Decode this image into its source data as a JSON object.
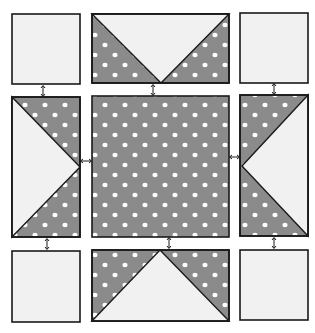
{
  "diagram": {
    "type": "quilt-block-assembly",
    "colors": {
      "background": "#ffffff",
      "light_fabric": "#f1f1f1",
      "dark_fabric": "#8b8b8b",
      "dots": "#ffffff",
      "outline": "#1a1a1a"
    },
    "grid": {
      "rows": 3,
      "cols": 3
    },
    "units": [
      {
        "id": "top-left",
        "kind": "plain-square",
        "fabric": "light"
      },
      {
        "id": "top-center",
        "kind": "flying-geese",
        "point": "down"
      },
      {
        "id": "top-right",
        "kind": "plain-square",
        "fabric": "light"
      },
      {
        "id": "middle-left",
        "kind": "flying-geese",
        "point": "right"
      },
      {
        "id": "center",
        "kind": "plain-square",
        "fabric": "dark-dotted"
      },
      {
        "id": "middle-right",
        "kind": "flying-geese",
        "point": "left"
      },
      {
        "id": "bottom-left",
        "kind": "plain-square",
        "fabric": "light"
      },
      {
        "id": "bottom-center",
        "kind": "flying-geese",
        "point": "up"
      },
      {
        "id": "bottom-right",
        "kind": "plain-square",
        "fabric": "light"
      }
    ],
    "join_arrows": 8
  }
}
